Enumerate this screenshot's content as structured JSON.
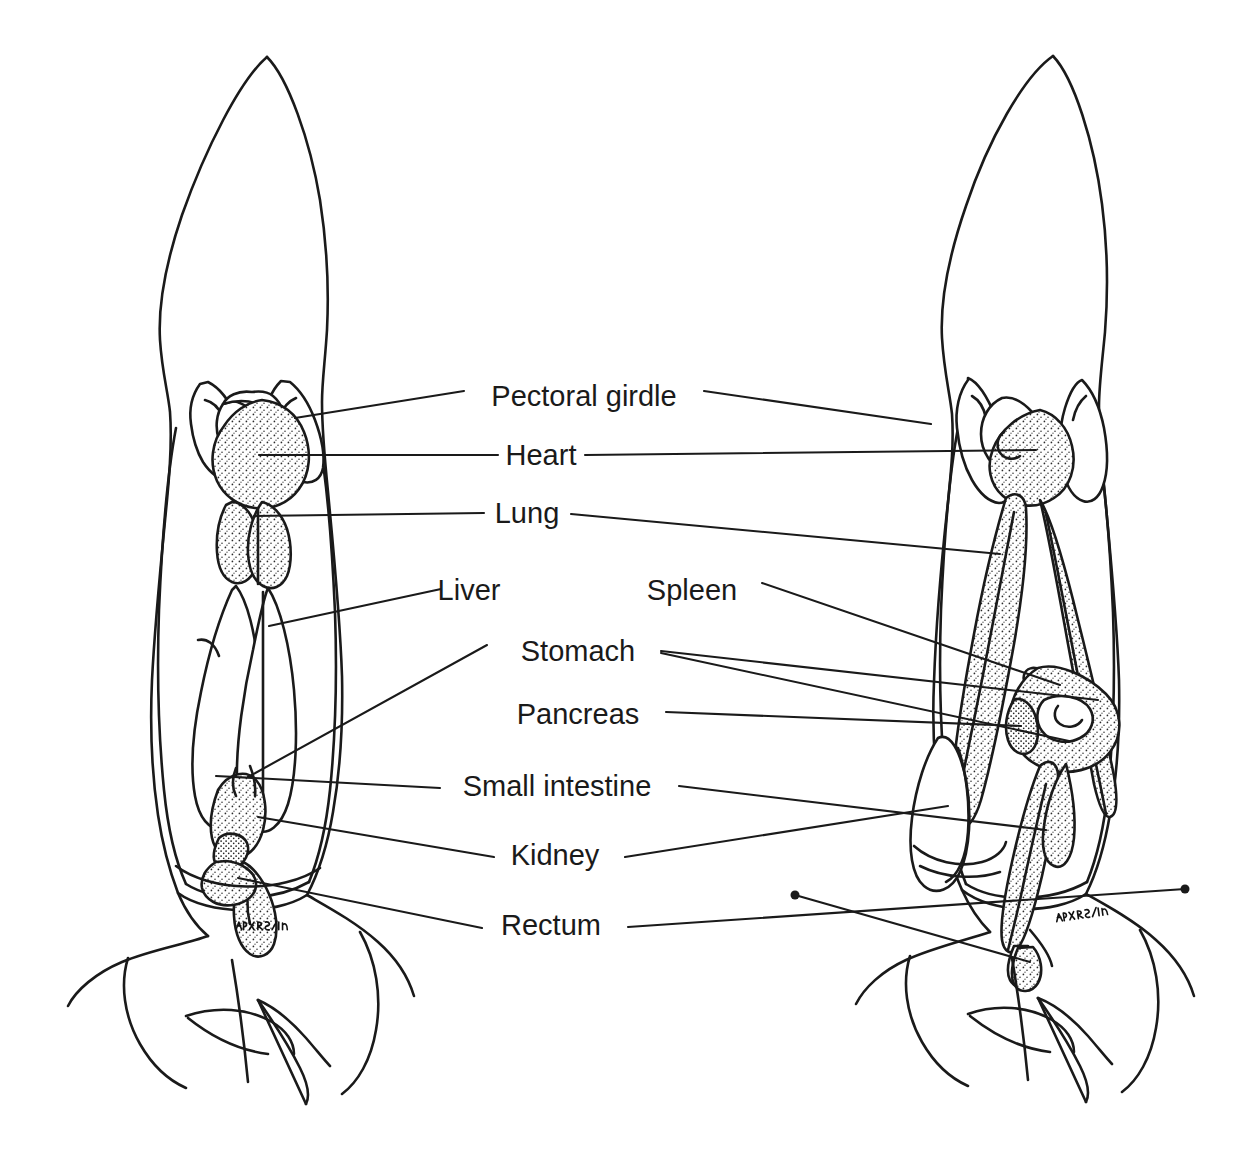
{
  "figure": {
    "view_count": 2,
    "ink_color": "#1a1a1a",
    "background_color": "#ffffff",
    "specimens": [
      {
        "id": "left-specimen",
        "name": "Left specimen — superficial ventral dissection",
        "signature": "AMN 2/19"
      },
      {
        "id": "right-specimen",
        "name": "Right specimen — deep ventral dissection",
        "signature": "AMN 2/19"
      }
    ]
  },
  "labels": [
    {
      "id": "pectoral-girdle",
      "text": "Pectoral girdle",
      "cx": 584,
      "cy": 396
    },
    {
      "id": "heart",
      "text": "Heart",
      "cx": 541,
      "cy": 455
    },
    {
      "id": "lung",
      "text": "Lung",
      "cx": 527,
      "cy": 513
    },
    {
      "id": "liver",
      "text": "Liver",
      "cx": 469,
      "cy": 590
    },
    {
      "id": "spleen",
      "text": "Spleen",
      "cx": 692,
      "cy": 590
    },
    {
      "id": "stomach",
      "text": "Stomach",
      "cx": 578,
      "cy": 651
    },
    {
      "id": "pancreas",
      "text": "Pancreas",
      "cx": 578,
      "cy": 714
    },
    {
      "id": "small-intestine",
      "text": "Small intestine",
      "cx": 557,
      "cy": 786
    },
    {
      "id": "kidney",
      "text": "Kidney",
      "cx": 555,
      "cy": 855
    },
    {
      "id": "rectum",
      "text": "Rectum",
      "cx": 551,
      "cy": 925
    }
  ],
  "leader_lines": {
    "description": "Thin straight rules running from each label out to the organ it names on one or both specimens.",
    "count": 20
  },
  "annotations": [
    {
      "id": "signature-left",
      "text": "AMN 2/19",
      "x": 252,
      "y": 930
    },
    {
      "id": "signature-right",
      "text": "AMN 2/19",
      "x": 1072,
      "y": 922
    }
  ]
}
